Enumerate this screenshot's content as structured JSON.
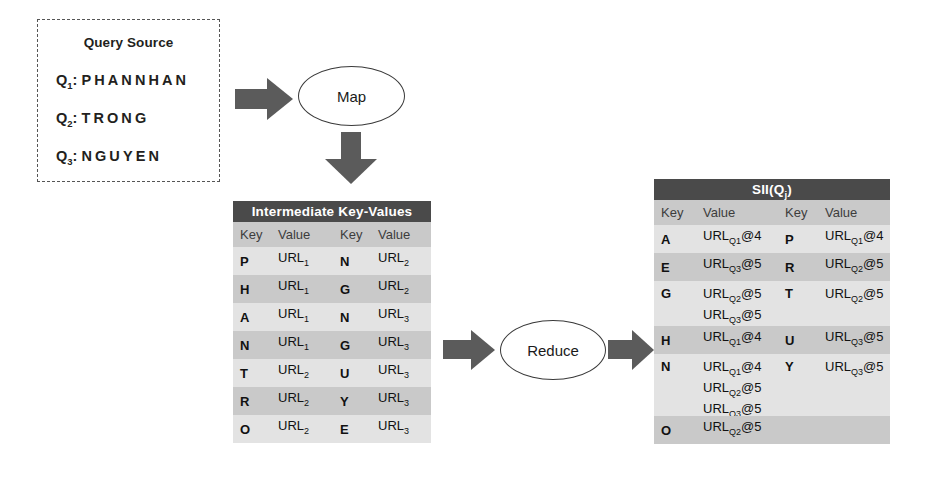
{
  "query_source": {
    "title": "Query Source",
    "queries": [
      {
        "label": "Q",
        "sub": "1",
        "colon": ":",
        "text": "PHANNHAN"
      },
      {
        "label": "Q",
        "sub": "2",
        "colon": ":",
        "text": "TRONG"
      },
      {
        "label": "Q",
        "sub": "3",
        "colon": ":",
        "text": "NGUYEN"
      }
    ]
  },
  "nodes": {
    "map_label": "Map",
    "reduce_label": "Reduce"
  },
  "arrows": {
    "source_to_map": "arrow-right",
    "map_to_intermediate": "arrow-down",
    "intermediate_to_reduce": "arrow-right",
    "reduce_to_sii": "arrow-right"
  },
  "intermediate_table": {
    "title": "Intermediate Key-Values",
    "columns": [
      "Key",
      "Value",
      "Key",
      "Value"
    ],
    "rows": [
      {
        "key1": "P",
        "val1": "URL",
        "val1sub": "1",
        "key2": "N",
        "val2": "URL",
        "val2sub": "2"
      },
      {
        "key1": "H",
        "val1": "URL",
        "val1sub": "1",
        "key2": "G",
        "val2": "URL",
        "val2sub": "2"
      },
      {
        "key1": "A",
        "val1": "URL",
        "val1sub": "1",
        "key2": "N",
        "val2": "URL",
        "val2sub": "3"
      },
      {
        "key1": "N",
        "val1": "URL",
        "val1sub": "1",
        "key2": "G",
        "val2": "URL",
        "val2sub": "3"
      },
      {
        "key1": "T",
        "val1": "URL",
        "val1sub": "2",
        "key2": "U",
        "val2": "URL",
        "val2sub": "3"
      },
      {
        "key1": "R",
        "val1": "URL",
        "val1sub": "2",
        "key2": "Y",
        "val2": "URL",
        "val2sub": "3"
      },
      {
        "key1": "O",
        "val1": "URL",
        "val1sub": "2",
        "key2": "E",
        "val2": "URL",
        "val2sub": "3"
      }
    ]
  },
  "sii_table": {
    "title": "SII(Q",
    "title_sub": "j",
    "title_tail": ")",
    "columns": [
      "Key",
      "Value",
      "Key",
      "Value"
    ],
    "rows": [
      {
        "key1": "A",
        "val1": [
          {
            "base": "URL",
            "sub": "Q1",
            "tail": "@4"
          }
        ],
        "key2": "P",
        "val2": [
          {
            "base": "URL",
            "sub": "Q1",
            "tail": "@4"
          }
        ]
      },
      {
        "key1": "E",
        "val1": [
          {
            "base": "URL",
            "sub": "Q3",
            "tail": "@5"
          }
        ],
        "key2": "R",
        "val2": [
          {
            "base": "URL",
            "sub": "Q2",
            "tail": "@5"
          }
        ]
      },
      {
        "key1": "G",
        "val1": [
          {
            "base": "URL",
            "sub": "Q2",
            "tail": "@5"
          },
          {
            "base": "URL",
            "sub": "Q3",
            "tail": "@5"
          }
        ],
        "key2": "T",
        "val2": [
          {
            "base": "URL",
            "sub": "Q2",
            "tail": "@5"
          }
        ]
      },
      {
        "key1": "H",
        "val1": [
          {
            "base": "URL",
            "sub": "Q1",
            "tail": "@4"
          }
        ],
        "key2": "U",
        "val2": [
          {
            "base": "URL",
            "sub": "Q3",
            "tail": "@5"
          }
        ]
      },
      {
        "key1": "N",
        "val1": [
          {
            "base": "URL",
            "sub": "Q1",
            "tail": "@4"
          },
          {
            "base": "URL",
            "sub": "Q2",
            "tail": "@5"
          },
          {
            "base": "URL",
            "sub": "Q3",
            "tail": "@5"
          }
        ],
        "key2": "Y",
        "val2": [
          {
            "base": "URL",
            "sub": "Q3",
            "tail": "@5"
          }
        ]
      },
      {
        "key1": "O",
        "val1": [
          {
            "base": "URL",
            "sub": "Q2",
            "tail": "@5"
          }
        ],
        "key2": "",
        "val2": []
      }
    ]
  },
  "colors": {
    "header_dark": "#4a4a4a",
    "arrow_gray": "#5b5b5b",
    "row_light": "#e3e3e3",
    "row_dark": "#c9c9c9",
    "text": "#231f20"
  }
}
